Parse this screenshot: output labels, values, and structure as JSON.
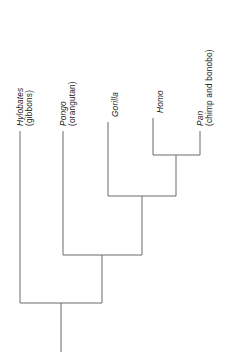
{
  "figure": {
    "type": "cladogram",
    "orientation": "tips-up-root-down",
    "line_color": "#6b6b6b",
    "text_color": "#1a1a1a",
    "background": "#ffffff"
  },
  "taxa": [
    {
      "id": "hylobates",
      "genus": "Hylobates",
      "common": "(gibbons)",
      "x": 20,
      "tip_y": 131,
      "base_y": 303
    },
    {
      "id": "pongo",
      "genus": "Pongo",
      "common": "(orangutan)",
      "x": 63,
      "tip_y": 131,
      "base_y": 255
    },
    {
      "id": "gorilla",
      "genus": "Gorilla",
      "common": "",
      "x": 108,
      "tip_y": 122,
      "base_y": 196
    },
    {
      "id": "homo",
      "genus": "Homo",
      "common": "",
      "x": 153,
      "tip_y": 118,
      "base_y": 155
    },
    {
      "id": "pan",
      "genus": "Pan",
      "common": "(chimp and bonobo)",
      "x": 200,
      "tip_y": 131,
      "base_y": 155
    }
  ],
  "nodes": [
    {
      "id": "node-homo-pan",
      "label": "Homo + Pan clade",
      "y": 155,
      "x_left": 153,
      "x_right": 200,
      "x_center": 176,
      "parent_y": 196
    },
    {
      "id": "node-african-apes",
      "label": "Gorilla + (Homo, Pan) clade",
      "y": 196,
      "x_left": 108,
      "x_right": 176,
      "x_center": 142,
      "parent_y": 255
    },
    {
      "id": "node-great-apes",
      "label": "Pongo + African apes clade",
      "y": 255,
      "x_left": 63,
      "x_right": 142,
      "x_center": 102,
      "parent_y": 303
    },
    {
      "id": "node-root",
      "label": "Hominoid root",
      "y": 303,
      "x_left": 20,
      "x_right": 102,
      "x_center": 61,
      "parent_y": 352
    }
  ],
  "root_stem": {
    "x": 61,
    "y_top": 303,
    "y_bottom": 352
  },
  "labels": {
    "hylobates_genus": "Hylobates",
    "hylobates_common": "(gibbons)",
    "pongo_genus": "Pongo",
    "pongo_common": "(orangutan)",
    "gorilla_genus": "Gorilla",
    "homo_genus": "Homo",
    "pan_genus": "Pan",
    "pan_common": "(chimp and bonobo)"
  }
}
